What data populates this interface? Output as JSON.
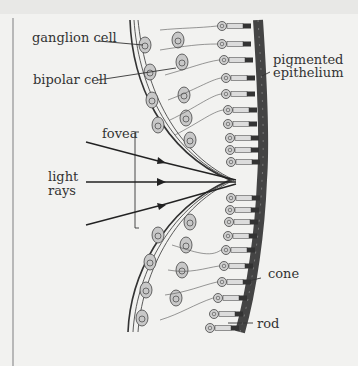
{
  "diagram": {
    "labels": {
      "ganglion_cell": "ganglion cell",
      "bipolar_cell": "bipolar cell",
      "pigmented_epithelium_line1": "pigmented",
      "pigmented_epithelium_line2": "epithelium",
      "fovea": "fovea",
      "light_rays_line1": "light",
      "light_rays_line2": "rays",
      "cone": "cone",
      "rod": "rod"
    },
    "colors": {
      "background": "#f2f2f0",
      "ink": "#333333",
      "epithelium": "#555555",
      "cell_fill": "#c8c8c8",
      "rod_fill": "#d8d8d8"
    },
    "light_ray_count": 3
  }
}
